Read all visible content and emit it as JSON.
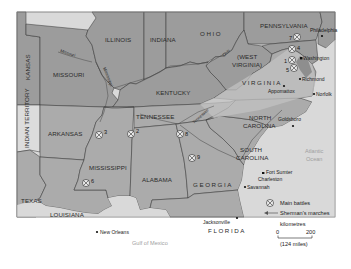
{
  "map": {
    "title": "American Civil War – main battles and Sherman's marches",
    "colors": {
      "union": "#9a9a9a",
      "confederate": "#a9a9a9",
      "virginia_band": "#bdbdbd",
      "water": "#d9d9d9",
      "border": "#333333",
      "frame": "#8a8a8a"
    },
    "states": [
      {
        "id": "kansas",
        "label": "KANSAS"
      },
      {
        "id": "indian-territory",
        "label": "INDIAN TERRITORY"
      },
      {
        "id": "missouri",
        "label": "MISSOURI"
      },
      {
        "id": "illinois",
        "label": "ILLINOIS"
      },
      {
        "id": "indiana",
        "label": "INDIANA"
      },
      {
        "id": "ohio",
        "label": "OHIO"
      },
      {
        "id": "pennsylvania",
        "label": "PENNSYLVANIA"
      },
      {
        "id": "west-virginia",
        "label_line1": "(WEST",
        "label_line2": "VIRGINIA)"
      },
      {
        "id": "kentucky",
        "label": "KENTUCKY"
      },
      {
        "id": "virginia",
        "label": "VIRGINIA"
      },
      {
        "id": "tennessee",
        "label": "TENNESSEE"
      },
      {
        "id": "north-carolina",
        "label_line1": "NORTH",
        "label_line2": "CAROLINA"
      },
      {
        "id": "arkansas",
        "label": "ARKANSAS"
      },
      {
        "id": "mississippi",
        "label": "MISSISSIPPI"
      },
      {
        "id": "alabama",
        "label": "ALABAMA"
      },
      {
        "id": "georgia",
        "label": "GEORGIA"
      },
      {
        "id": "south-carolina",
        "label_line1": "SOUTH",
        "label_line2": "CAROLINA"
      },
      {
        "id": "texas",
        "label": "TEXAS"
      },
      {
        "id": "louisiana",
        "label": "LOUISIANA"
      },
      {
        "id": "florida",
        "label": "FLORIDA"
      }
    ],
    "rivers": [
      {
        "id": "missouri-river",
        "label": "Missouri"
      },
      {
        "id": "mississippi-river",
        "label": "Mississippi"
      },
      {
        "id": "ohio-river",
        "label": "Ohio"
      },
      {
        "id": "tennessee-river",
        "label": "Tennessee"
      }
    ],
    "cities": [
      {
        "id": "philadelphia",
        "label": "Philadelphia"
      },
      {
        "id": "washington",
        "label": "Washington"
      },
      {
        "id": "richmond",
        "label": "Richmond"
      },
      {
        "id": "appomattox",
        "label": "Appomattox"
      },
      {
        "id": "norfolk",
        "label": "Norfolk"
      },
      {
        "id": "goldsboro",
        "label": "Goldsboro"
      },
      {
        "id": "fort-sumter",
        "label": "Fort Sumter"
      },
      {
        "id": "charleston",
        "label": "Charleston"
      },
      {
        "id": "savannah",
        "label": "Savannah"
      },
      {
        "id": "jacksonville",
        "label": "Jacksonville"
      },
      {
        "id": "new-orleans",
        "label": "New Orleans"
      }
    ],
    "water_bodies": [
      {
        "id": "atlantic-ocean",
        "label_line1": "Atlantic",
        "label_line2": "Ocean"
      },
      {
        "id": "gulf-of-mexico",
        "label": "Gulf of Mexico"
      }
    ],
    "battles": [
      {
        "number": "1",
        "location": "near Washington"
      },
      {
        "number": "2",
        "location": "Tennessee–Mississippi border"
      },
      {
        "number": "3",
        "location": "Mississippi River, Arkansas–Mississippi border"
      },
      {
        "number": "4",
        "location": "Maryland"
      },
      {
        "number": "5",
        "location": "northern Virginia"
      },
      {
        "number": "6",
        "location": "Mississippi (Vicksburg area)"
      },
      {
        "number": "7",
        "location": "Pennsylvania"
      },
      {
        "number": "8",
        "location": "Tennessee–Georgia border"
      },
      {
        "number": "9",
        "location": "Georgia"
      }
    ],
    "legend": {
      "main_battles": "Main battles",
      "shermans_marches": "Sherman's marches",
      "scale_title": "kilometres",
      "scale_start": "0",
      "scale_end": "200",
      "scale_miles": "(124 miles)"
    }
  }
}
